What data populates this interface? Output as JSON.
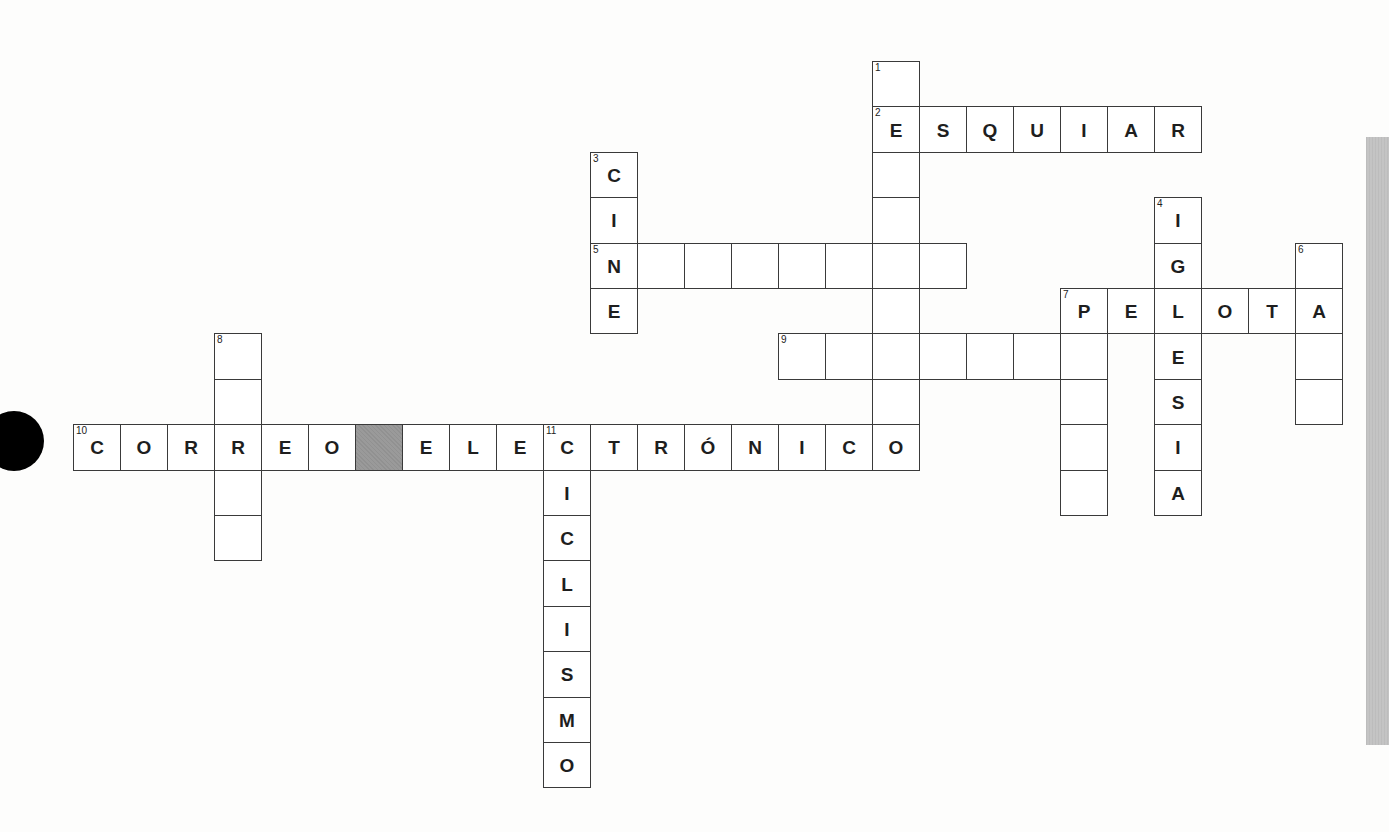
{
  "puzzle": {
    "title": "Crucigrama",
    "grid": {
      "origin_x": 73,
      "origin_y": 61,
      "cell_w": 47,
      "cell_h": 45.4
    },
    "colors": {
      "border": "#3a3a3a",
      "block": "#9a9a9a",
      "letter": "#1e1e1e",
      "side_bar": "#c4c4c4"
    },
    "words": [
      {
        "number": "1",
        "direction": "down",
        "col": 17,
        "row": 0,
        "length": 9,
        "answer": [
          " ",
          "E",
          " ",
          " ",
          " ",
          " ",
          " ",
          " ",
          "O"
        ]
      },
      {
        "number": "2",
        "direction": "across",
        "col": 17,
        "row": 1,
        "length": 7,
        "answer": [
          "E",
          "S",
          "Q",
          "U",
          "I",
          "A",
          "R"
        ]
      },
      {
        "number": "3",
        "direction": "down",
        "col": 11,
        "row": 2,
        "length": 4,
        "answer": [
          "C",
          "I",
          "N",
          "E"
        ]
      },
      {
        "number": "4",
        "direction": "down",
        "col": 23,
        "row": 3,
        "length": 7,
        "answer": [
          "I",
          "G",
          "L",
          "E",
          "S",
          "I",
          "A"
        ]
      },
      {
        "number": "5",
        "direction": "across",
        "col": 11,
        "row": 4,
        "length": 8,
        "answer": [
          "N",
          " ",
          " ",
          " ",
          " ",
          " ",
          " ",
          " "
        ]
      },
      {
        "number": "6",
        "direction": "down",
        "col": 26,
        "row": 4,
        "length": 4,
        "answer": [
          " ",
          "A",
          " ",
          " "
        ]
      },
      {
        "number": "7",
        "direction": "across",
        "col": 21,
        "row": 5,
        "length": 6,
        "answer": [
          "P",
          "E",
          "L",
          "O",
          "T",
          "A"
        ]
      },
      {
        "number": "7",
        "direction": "down",
        "col": 21,
        "row": 5,
        "length": 5,
        "answer": [
          "P",
          " ",
          " ",
          " ",
          " "
        ]
      },
      {
        "number": "8",
        "direction": "down",
        "col": 3,
        "row": 6,
        "length": 5,
        "answer": [
          " ",
          " ",
          "R",
          " ",
          " "
        ]
      },
      {
        "number": "9",
        "direction": "across",
        "col": 15,
        "row": 6,
        "length": 7,
        "answer": [
          " ",
          " ",
          " ",
          " ",
          " ",
          " ",
          " "
        ]
      },
      {
        "number": "10",
        "direction": "across",
        "col": 0,
        "row": 8,
        "length": 19,
        "answer": [
          "C",
          "O",
          "R",
          "R",
          "E",
          "O",
          "#",
          "E",
          "L",
          "E",
          "C",
          "T",
          "R",
          "Ó",
          "N",
          "I",
          "C",
          "O"
        ]
      },
      {
        "number": "11",
        "direction": "down",
        "col": 10,
        "row": 8,
        "length": 8,
        "answer": [
          "C",
          "I",
          "C",
          "L",
          "I",
          "S",
          "M",
          "O"
        ]
      }
    ],
    "cells": [
      {
        "c": 17,
        "r": 0,
        "n": "1",
        "l": ""
      },
      {
        "c": 17,
        "r": 1,
        "n": "2",
        "l": "E"
      },
      {
        "c": 18,
        "r": 1,
        "l": "S"
      },
      {
        "c": 19,
        "r": 1,
        "l": "Q"
      },
      {
        "c": 20,
        "r": 1,
        "l": "U"
      },
      {
        "c": 21,
        "r": 1,
        "l": "I"
      },
      {
        "c": 22,
        "r": 1,
        "l": "A"
      },
      {
        "c": 23,
        "r": 1,
        "l": "R"
      },
      {
        "c": 11,
        "r": 2,
        "n": "3",
        "l": "C"
      },
      {
        "c": 17,
        "r": 2,
        "l": ""
      },
      {
        "c": 11,
        "r": 3,
        "l": "I"
      },
      {
        "c": 17,
        "r": 3,
        "l": ""
      },
      {
        "c": 23,
        "r": 3,
        "n": "4",
        "l": "I"
      },
      {
        "c": 11,
        "r": 4,
        "n": "5",
        "l": "N"
      },
      {
        "c": 12,
        "r": 4,
        "l": ""
      },
      {
        "c": 13,
        "r": 4,
        "l": ""
      },
      {
        "c": 14,
        "r": 4,
        "l": ""
      },
      {
        "c": 15,
        "r": 4,
        "l": ""
      },
      {
        "c": 16,
        "r": 4,
        "l": ""
      },
      {
        "c": 17,
        "r": 4,
        "l": ""
      },
      {
        "c": 18,
        "r": 4,
        "l": ""
      },
      {
        "c": 23,
        "r": 4,
        "l": "G"
      },
      {
        "c": 26,
        "r": 4,
        "n": "6",
        "l": ""
      },
      {
        "c": 11,
        "r": 5,
        "l": "E"
      },
      {
        "c": 17,
        "r": 5,
        "l": ""
      },
      {
        "c": 21,
        "r": 5,
        "n": "7",
        "l": "P"
      },
      {
        "c": 22,
        "r": 5,
        "l": "E"
      },
      {
        "c": 23,
        "r": 5,
        "l": "L"
      },
      {
        "c": 24,
        "r": 5,
        "l": "O"
      },
      {
        "c": 25,
        "r": 5,
        "l": "T"
      },
      {
        "c": 26,
        "r": 5,
        "l": "A"
      },
      {
        "c": 3,
        "r": 6,
        "n": "8",
        "l": ""
      },
      {
        "c": 15,
        "r": 6,
        "n": "9",
        "l": ""
      },
      {
        "c": 16,
        "r": 6,
        "l": ""
      },
      {
        "c": 17,
        "r": 6,
        "l": ""
      },
      {
        "c": 18,
        "r": 6,
        "l": ""
      },
      {
        "c": 19,
        "r": 6,
        "l": ""
      },
      {
        "c": 20,
        "r": 6,
        "l": ""
      },
      {
        "c": 21,
        "r": 6,
        "l": ""
      },
      {
        "c": 23,
        "r": 6,
        "l": "E"
      },
      {
        "c": 26,
        "r": 6,
        "l": ""
      },
      {
        "c": 3,
        "r": 7,
        "l": ""
      },
      {
        "c": 17,
        "r": 7,
        "l": ""
      },
      {
        "c": 21,
        "r": 7,
        "l": ""
      },
      {
        "c": 23,
        "r": 7,
        "l": "S"
      },
      {
        "c": 26,
        "r": 7,
        "l": ""
      },
      {
        "c": 0,
        "r": 8,
        "n": "10",
        "l": "C"
      },
      {
        "c": 1,
        "r": 8,
        "l": "O"
      },
      {
        "c": 2,
        "r": 8,
        "l": "R"
      },
      {
        "c": 3,
        "r": 8,
        "l": "R"
      },
      {
        "c": 4,
        "r": 8,
        "l": "E"
      },
      {
        "c": 5,
        "r": 8,
        "l": "O"
      },
      {
        "c": 6,
        "r": 8,
        "block": true,
        "l": ""
      },
      {
        "c": 7,
        "r": 8,
        "l": "E"
      },
      {
        "c": 8,
        "r": 8,
        "l": "L"
      },
      {
        "c": 9,
        "r": 8,
        "l": "E"
      },
      {
        "c": 10,
        "r": 8,
        "n": "11",
        "l": "C"
      },
      {
        "c": 11,
        "r": 8,
        "l": "T"
      },
      {
        "c": 12,
        "r": 8,
        "l": "R"
      },
      {
        "c": 13,
        "r": 8,
        "l": "Ó"
      },
      {
        "c": 14,
        "r": 8,
        "l": "N"
      },
      {
        "c": 15,
        "r": 8,
        "l": "I"
      },
      {
        "c": 16,
        "r": 8,
        "l": "C"
      },
      {
        "c": 17,
        "r": 8,
        "l": "O"
      },
      {
        "c": 21,
        "r": 8,
        "l": ""
      },
      {
        "c": 23,
        "r": 8,
        "l": "I"
      },
      {
        "c": 3,
        "r": 9,
        "l": ""
      },
      {
        "c": 10,
        "r": 9,
        "l": "I"
      },
      {
        "c": 21,
        "r": 9,
        "l": ""
      },
      {
        "c": 23,
        "r": 9,
        "l": "A"
      },
      {
        "c": 3,
        "r": 10,
        "l": ""
      },
      {
        "c": 10,
        "r": 10,
        "l": "C"
      },
      {
        "c": 10,
        "r": 11,
        "l": "L"
      },
      {
        "c": 10,
        "r": 12,
        "l": "I"
      },
      {
        "c": 10,
        "r": 13,
        "l": "S"
      },
      {
        "c": 10,
        "r": 14,
        "l": "M"
      },
      {
        "c": 10,
        "r": 15,
        "l": "O"
      }
    ]
  }
}
